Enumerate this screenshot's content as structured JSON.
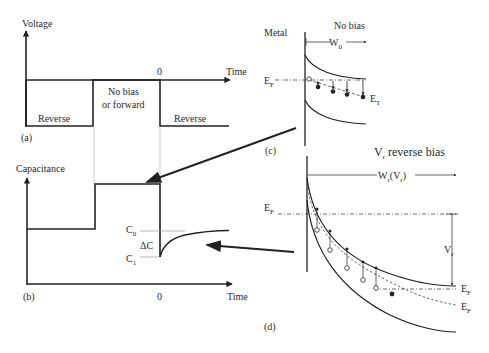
{
  "panel_a": {
    "tag": "(a)",
    "y_axis_label": "Voltage",
    "x_axis_label": "Time",
    "zero_label": "0",
    "segments": [
      {
        "label": "Reverse"
      },
      {
        "label_line1": "No bias",
        "label_line2": "or forward"
      },
      {
        "label": "Reverse"
      }
    ]
  },
  "panel_b": {
    "tag": "(b)",
    "y_axis_label": "Capacitance",
    "x_axis_label": "Time",
    "zero_label": "0",
    "c0_label": "C",
    "c0_sub": "0",
    "c1_label": "C",
    "c1_sub": "1",
    "delta_label": "ΔC"
  },
  "panel_c": {
    "tag": "(c)",
    "title": "No bias",
    "metal_label": "Metal",
    "width_label": "W",
    "width_sub": "0",
    "ef_label": "E",
    "ef_sub": "F",
    "et_label": "E",
    "et_sub": "T"
  },
  "panel_d": {
    "tag": "(d)",
    "title_v": "V",
    "title_v_sub": "r",
    "title_rest": " reverse bias",
    "width_label": "W",
    "width_sub": "r",
    "width_paren_open": "(V",
    "width_paren_sub": "r",
    "width_paren_close": ")",
    "ef_left_label": "E",
    "ef_left_sub": "F",
    "vr_label": "V",
    "vr_sub": "r",
    "ef_right1_label": "E",
    "ef_right1_sub": "F",
    "ef_right2_label": "E",
    "ef_right2_sub": "F"
  },
  "colors": {
    "line": "#222222",
    "thin": "#555555",
    "guide": "#999999"
  }
}
